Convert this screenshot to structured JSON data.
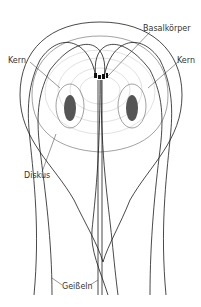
{
  "diagram": {
    "labels": {
      "basal": "Basalkörper",
      "kern_left": "Kern",
      "kern_right": "Kern",
      "diskus": "Diskus",
      "geisseln": "Geißeln"
    },
    "colors": {
      "line": "#1a1a1a",
      "nucleus": "#555555",
      "label": "#333333",
      "background": "#ffffff"
    }
  }
}
